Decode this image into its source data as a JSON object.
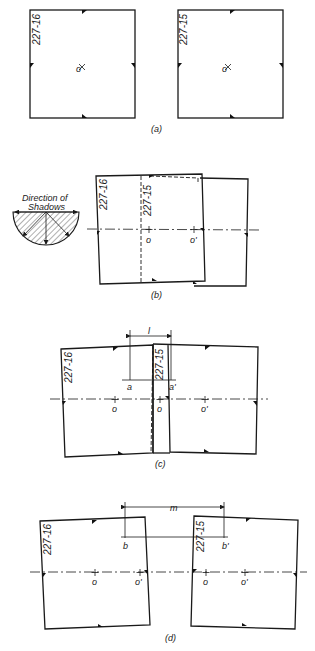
{
  "figure": {
    "panels": [
      {
        "id": "a",
        "caption": "(a)",
        "photo_labels": [
          "227-16",
          "227-15"
        ],
        "points": [
          "o",
          "o"
        ]
      },
      {
        "id": "b",
        "caption": "(b)",
        "photo_labels": [
          "227-16",
          "227-15"
        ],
        "points": [
          "o",
          "o'"
        ],
        "legend": {
          "title_line1": "Direction of",
          "title_line2": "Shadows"
        }
      },
      {
        "id": "c",
        "caption": "(c)",
        "photo_labels": [
          "227-16",
          "227-15"
        ],
        "points": [
          "o",
          "o",
          "o'"
        ],
        "measure_label": "l",
        "measure_points": [
          "a",
          "a'"
        ]
      },
      {
        "id": "d",
        "caption": "(d)",
        "photo_labels": [
          "227-16",
          "227-15"
        ],
        "points": [
          "o",
          "o'",
          "o",
          "o'"
        ],
        "measure_label": "m",
        "measure_points": [
          "b",
          "b'"
        ]
      }
    ]
  },
  "colors": {
    "ink": "#1a1a1a",
    "background": "#ffffff"
  }
}
